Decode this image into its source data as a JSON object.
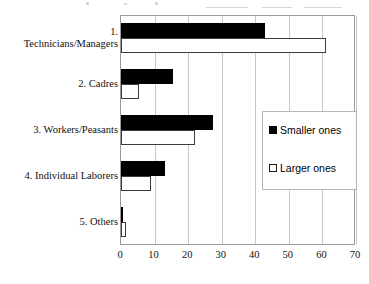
{
  "chart_data": {
    "type": "bar",
    "orientation": "horizontal",
    "title": "",
    "xlabel": "",
    "ylabel": "",
    "xlim": [
      0,
      70
    ],
    "xticks": [
      0,
      10,
      20,
      30,
      40,
      50,
      60,
      70
    ],
    "grid": true,
    "legend_position": "center-right",
    "categories": [
      "1.\nTechnicians/Managers",
      "2. Cadres",
      "3. Workers/Peasants",
      "4. Individual Laborers",
      "5. Others"
    ],
    "category_lines": [
      [
        "1.",
        "Technicians/Managers"
      ],
      [
        "2. Cadres"
      ],
      [
        "3. Workers/Peasants"
      ],
      [
        "4. Individual Laborers"
      ],
      [
        "5. Others"
      ]
    ],
    "series": [
      {
        "name": "Smaller ones",
        "color": "#000000",
        "values": [
          43,
          15.5,
          27.5,
          13,
          0.5
        ]
      },
      {
        "name": "Larger ones",
        "color": "#ffffff",
        "values": [
          61,
          5.5,
          22,
          9,
          1.5
        ]
      }
    ]
  },
  "legend": {
    "items": [
      {
        "label": "Smaller ones",
        "swatch": "filled-square-icon"
      },
      {
        "label": "Larger ones",
        "swatch": "hollow-square-icon"
      }
    ]
  },
  "colors": {
    "smaller_ones": "#000000",
    "larger_ones": "#ffffff",
    "bar_outline": "#3b3b3b",
    "gridline": "#c8c8c8",
    "plot_border": "#9a9a9a",
    "legend_border": "#b6b6b6",
    "background": "#ffffff",
    "text": "#111111"
  }
}
